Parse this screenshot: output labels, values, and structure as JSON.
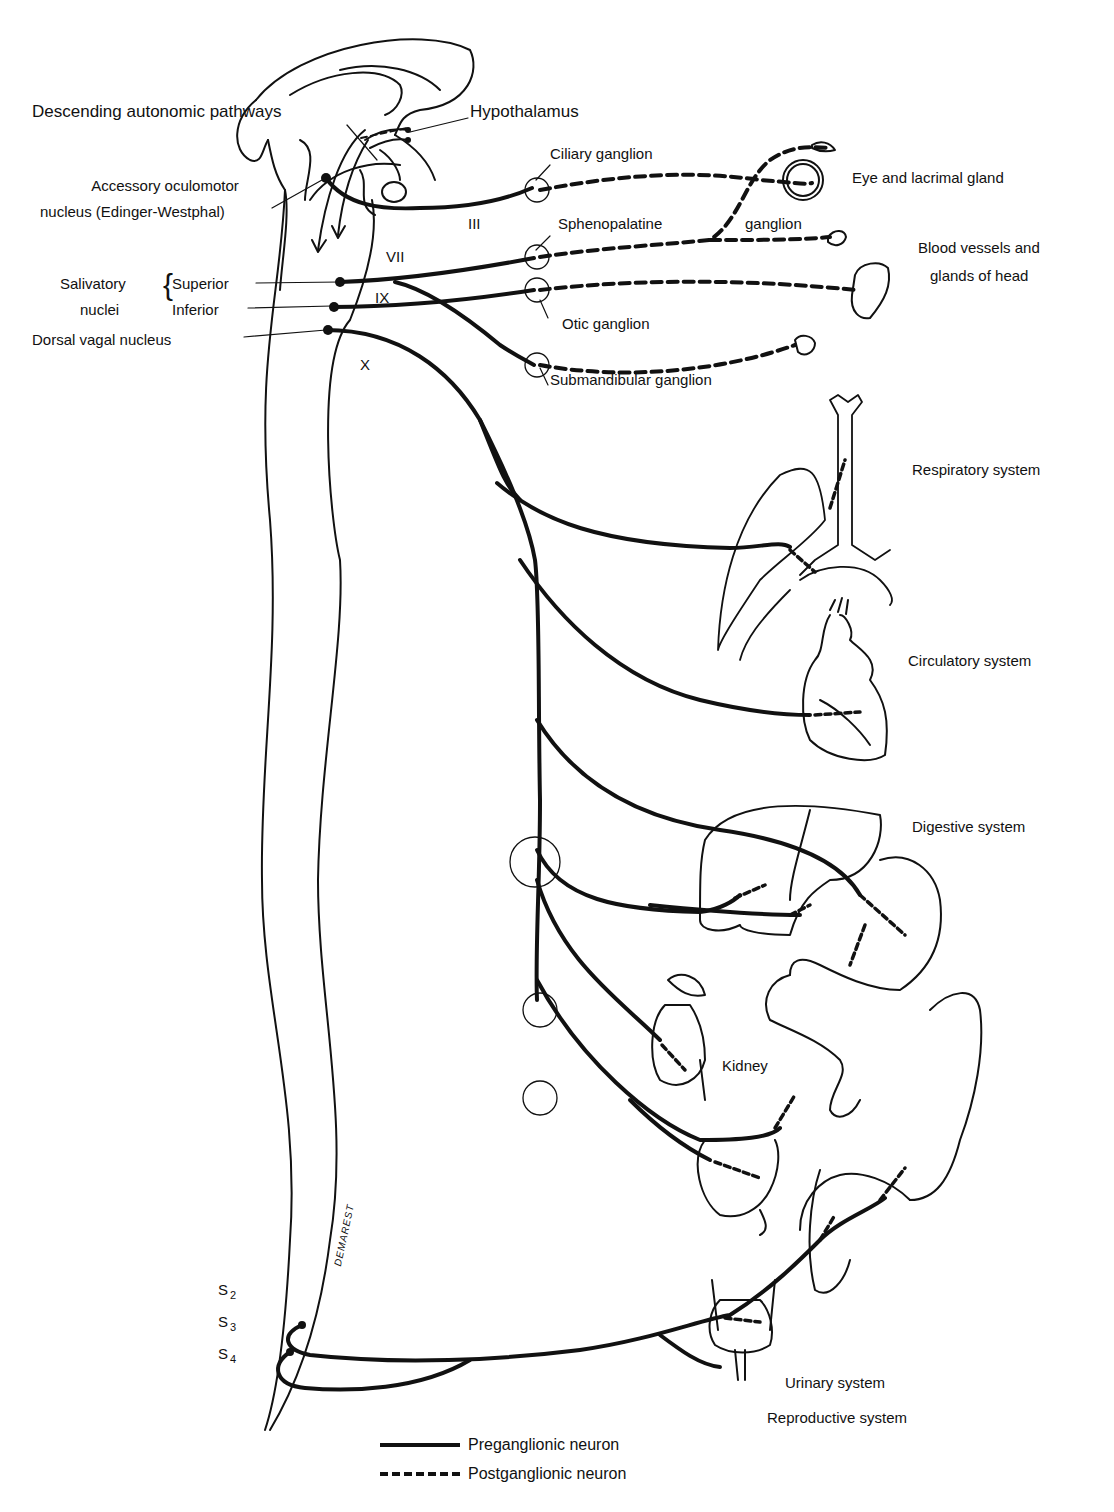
{
  "figure": {
    "type": "parasympathetic nervous system schematic",
    "colors": {
      "line": "#111111",
      "background": "#ffffff"
    }
  },
  "brain_labels": {
    "descending_pathways": "Descending autonomic pathways",
    "hypothalamus": "Hypothalamus",
    "accessory_line1": "Accessory oculomotor",
    "accessory_line2": "nucleus (Edinger-Westphal)"
  },
  "nuclei": {
    "salivatory_line1": "Salivatory",
    "salivatory_line2": "nuclei",
    "superior": "Superior",
    "inferior": "Inferior",
    "dorsal_vagal": "Dorsal vagal nucleus"
  },
  "cranial_nerves": [
    "III",
    "VII",
    "IX",
    "X"
  ],
  "ganglia": {
    "ciliary": "Ciliary ganglion",
    "sphenopalatine": "Sphenopalatine",
    "sphenopalatine_suffix": "ganglion",
    "otic": "Otic ganglion",
    "submandibular": "Submandibular ganglion"
  },
  "targets": {
    "eye": "Eye and lacrimal gland",
    "blood_vessels_line1": "Blood vessels and",
    "blood_vessels_line2": "glands of head",
    "respiratory": "Respiratory system",
    "circulatory": "Circulatory system",
    "digestive": "Digestive system",
    "kidney": "Kidney",
    "urinary": "Urinary system",
    "reproductive": "Reproductive system"
  },
  "sacral": {
    "s2": "S",
    "s2_sub": "2",
    "s3": "S",
    "s3_sub": "3",
    "s4": "S",
    "s4_sub": "4"
  },
  "signature": "DEMAREST",
  "legend": {
    "preganglionic": "Preganglionic neuron",
    "postganglionic": "Postganglionic neuron"
  }
}
